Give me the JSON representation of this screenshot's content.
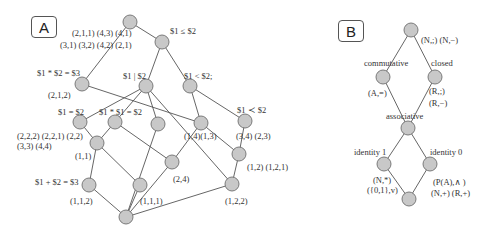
{
  "panels": {
    "A": {
      "label": "A",
      "nodes": [
        {
          "id": "top",
          "x": 130,
          "y": 22
        },
        {
          "id": "le",
          "x": 162,
          "y": 42
        },
        {
          "id": "n3",
          "x": 82,
          "y": 84
        },
        {
          "id": "div",
          "x": 146,
          "y": 86
        },
        {
          "id": "lt",
          "x": 190,
          "y": 86
        },
        {
          "id": "eq",
          "x": 80,
          "y": 122
        },
        {
          "id": "mul",
          "x": 115,
          "y": 122
        },
        {
          "id": "c3",
          "x": 158,
          "y": 124
        },
        {
          "id": "c4",
          "x": 201,
          "y": 123
        },
        {
          "id": "prec",
          "x": 245,
          "y": 121
        },
        {
          "id": "n11",
          "x": 97,
          "y": 143
        },
        {
          "id": "n24",
          "x": 172,
          "y": 162
        },
        {
          "id": "n12",
          "x": 239,
          "y": 154
        },
        {
          "id": "add",
          "x": 89,
          "y": 185
        },
        {
          "id": "n111",
          "x": 140,
          "y": 185
        },
        {
          "id": "n122",
          "x": 232,
          "y": 184
        },
        {
          "id": "bot",
          "x": 126,
          "y": 217
        }
      ],
      "edges": [
        [
          "top",
          "le"
        ],
        [
          "top",
          "n3"
        ],
        [
          "le",
          "div"
        ],
        [
          "le",
          "lt"
        ],
        [
          "n3",
          "c4"
        ],
        [
          "div",
          "eq"
        ],
        [
          "div",
          "mul"
        ],
        [
          "div",
          "c3"
        ],
        [
          "div",
          "n122"
        ],
        [
          "lt",
          "c4"
        ],
        [
          "lt",
          "prec"
        ],
        [
          "eq",
          "n11"
        ],
        [
          "mul",
          "n11"
        ],
        [
          "mul",
          "n24"
        ],
        [
          "c3",
          "bot"
        ],
        [
          "c4",
          "n24"
        ],
        [
          "c4",
          "n12"
        ],
        [
          "prec",
          "n12"
        ],
        [
          "n11",
          "add"
        ],
        [
          "n11",
          "n111"
        ],
        [
          "n24",
          "bot"
        ],
        [
          "n12",
          "n122"
        ],
        [
          "add",
          "bot"
        ],
        [
          "n111",
          "bot"
        ],
        [
          "n122",
          "bot"
        ]
      ],
      "labels": [
        {
          "text": "(2,1,1) (4,3) (4,1)",
          "x": 72,
          "y": 28
        },
        {
          "text": "(3,1) (3,2) (4,2) (2,1)",
          "x": 60,
          "y": 40
        },
        {
          "text": "$1 ≤ $2",
          "x": 170,
          "y": 26
        },
        {
          "text": "$1 * $2 = $3",
          "x": 37,
          "y": 68
        },
        {
          "text": "(2,1,2)",
          "x": 48,
          "y": 90
        },
        {
          "text": "$1 | $2",
          "x": 123,
          "y": 71
        },
        {
          "text": "$1 < $2;",
          "x": 184,
          "y": 71
        },
        {
          "text": "$1 = $2",
          "x": 58,
          "y": 107
        },
        {
          "text": "$1 * $1 = $2",
          "x": 99,
          "y": 107
        },
        {
          "text": "$1 ≺ $2",
          "x": 237,
          "y": 105
        },
        {
          "text": "(2,2,2) (2,2,1) (2,2)",
          "x": 17,
          "y": 131
        },
        {
          "text": "(3,3)  (4,4)",
          "x": 17,
          "y": 141
        },
        {
          "text": "(1,1)",
          "x": 75,
          "y": 151
        },
        {
          "text": "(1,4)(1,3)",
          "x": 184,
          "y": 131
        },
        {
          "text": "(3,4)  (2,3)",
          "x": 236,
          "y": 131
        },
        {
          "text": "(1,2)  (1,2,1)",
          "x": 247,
          "y": 162
        },
        {
          "text": "(2,4)",
          "x": 173,
          "y": 174
        },
        {
          "text": "$1 + $2 = $3",
          "x": 35,
          "y": 177
        },
        {
          "text": "(1,1,2)",
          "x": 70,
          "y": 196
        },
        {
          "text": "(1,1,1)",
          "x": 140,
          "y": 196
        },
        {
          "text": "(1,2,2)",
          "x": 225,
          "y": 196
        }
      ]
    },
    "B": {
      "label": "B",
      "nodes": [
        {
          "id": "top",
          "x": 411,
          "y": 30
        },
        {
          "id": "comm",
          "x": 383,
          "y": 77
        },
        {
          "id": "closed",
          "x": 435,
          "y": 77
        },
        {
          "id": "assoc",
          "x": 408,
          "y": 128
        },
        {
          "id": "id1",
          "x": 384,
          "y": 164
        },
        {
          "id": "id0",
          "x": 430,
          "y": 164
        },
        {
          "id": "bot",
          "x": 409,
          "y": 199
        }
      ],
      "edges": [
        [
          "top",
          "comm"
        ],
        [
          "top",
          "closed"
        ],
        [
          "comm",
          "assoc"
        ],
        [
          "closed",
          "assoc"
        ],
        [
          "assoc",
          "id1"
        ],
        [
          "assoc",
          "id0"
        ],
        [
          "id1",
          "bot"
        ],
        [
          "id0",
          "bot"
        ]
      ],
      "labels": [
        {
          "text": "(N,;) (N,−)",
          "x": 421,
          "y": 35
        },
        {
          "text": "commutative",
          "x": 364,
          "y": 58
        },
        {
          "text": "closed",
          "x": 431,
          "y": 58
        },
        {
          "text": "(A,=)",
          "x": 368,
          "y": 88
        },
        {
          "text": "(R,;)",
          "x": 429,
          "y": 86
        },
        {
          "text": "(R,−)",
          "x": 429,
          "y": 98
        },
        {
          "text": "associative",
          "x": 386,
          "y": 111
        },
        {
          "text": "identity 1",
          "x": 354,
          "y": 147
        },
        {
          "text": "identity 0",
          "x": 430,
          "y": 147
        },
        {
          "text": "(N,*)",
          "x": 373,
          "y": 175
        },
        {
          "text": "({0,1},v)",
          "x": 367,
          "y": 185
        },
        {
          "text": "(P(A),∧ )",
          "x": 433,
          "y": 177
        },
        {
          "text": "(N,+)  (R,+)",
          "x": 431,
          "y": 188
        }
      ]
    }
  },
  "colors": {
    "node_fill": "#c8c8c8",
    "node_stroke": "#6f6f6f",
    "edge": "#555555"
  }
}
